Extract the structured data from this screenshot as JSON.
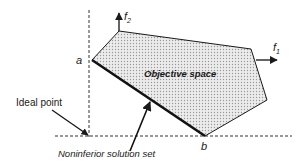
{
  "diagram": {
    "title": "",
    "labels": {
      "objective_space": "Objective space",
      "ideal_point": "Ideal point",
      "noninferior_set": "Noninferior solution set",
      "point_a": "a",
      "point_b": "b",
      "axis_f1": "f",
      "axis_f1_sub": "1",
      "axis_f2": "f",
      "axis_f2_sub": "2"
    },
    "colors": {
      "region_fill": "#d9d9d9",
      "stroke": "#1a1a1a",
      "background": "#ffffff"
    }
  }
}
